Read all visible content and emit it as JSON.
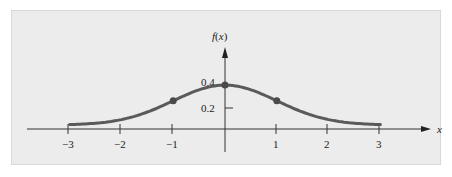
{
  "chart_data": {
    "type": "line",
    "title": "",
    "xlabel": "x",
    "ylabel": "f(x)",
    "x_ticks": [
      "−3",
      "−2",
      "−1",
      "1",
      "2",
      "3"
    ],
    "x_tick_values": [
      -3,
      -2,
      -1,
      1,
      2,
      3
    ],
    "y_ticks": [
      "0.2",
      "0.4"
    ],
    "y_tick_values": [
      0.2,
      0.4
    ],
    "xlim": [
      -3,
      3
    ],
    "ylim": [
      0,
      0.4
    ],
    "grid": false,
    "legend": null,
    "series": [
      {
        "name": "f(x) standard normal density",
        "x": [
          -3,
          -2.5,
          -2,
          -1.5,
          -1,
          -0.5,
          0,
          0.5,
          1,
          1.5,
          2,
          2.5,
          3
        ],
        "values": [
          0.004,
          0.018,
          0.054,
          0.13,
          0.242,
          0.352,
          0.399,
          0.352,
          0.242,
          0.13,
          0.054,
          0.018,
          0.004
        ],
        "color": "#5a5a5a"
      }
    ],
    "marked_points": [
      {
        "x": -1,
        "y": 0.242
      },
      {
        "x": 0,
        "y": 0.399
      },
      {
        "x": 1,
        "y": 0.242
      }
    ]
  },
  "labels": {
    "y_axis": "f(x)",
    "x_axis": "x",
    "y_tick_02": "0.2",
    "y_tick_04": "0.4",
    "x_tick_m3": "−3",
    "x_tick_m2": "−2",
    "x_tick_m1": "−1",
    "x_tick_1": "1",
    "x_tick_2": "2",
    "x_tick_3": "3"
  },
  "colors": {
    "panel_bg": "#ececec",
    "axis": "#333333",
    "curve": "#5a5a5a"
  }
}
